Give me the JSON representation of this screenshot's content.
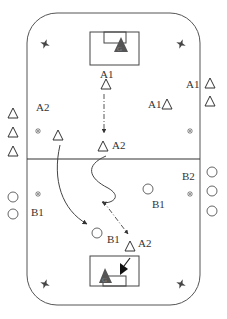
{
  "diagram": {
    "type": "field-drill",
    "colors": {
      "stroke": "#444444",
      "goalkeeper": "#555555",
      "background": "#ffffff"
    },
    "labels": {
      "a1_top": "A1",
      "a1_mid": "A1",
      "a1_side": "A1",
      "a2_left": "A2",
      "a2_center": "A2",
      "a2_bottom": "A2",
      "b1_left": "B1",
      "b1_right": "B1",
      "b1_bottom": "B1",
      "b2_right": "B2"
    },
    "goals": [
      {
        "position": "top",
        "goalkeeper": "G"
      },
      {
        "position": "bottom",
        "goalkeeper": "G"
      }
    ],
    "icons": [
      "cone-star-icon",
      "marker-x-icon",
      "triangle-player-icon",
      "circle-player-icon",
      "pass-arrow-icon",
      "dribble-path-icon",
      "run-arrow-icon"
    ]
  }
}
